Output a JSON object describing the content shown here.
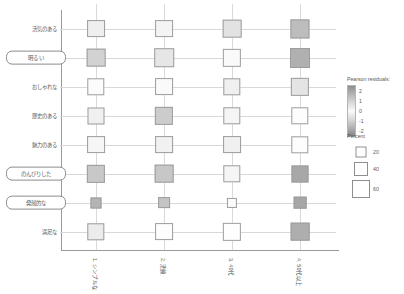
{
  "chart_data": {
    "type": "heatmap",
    "title": "",
    "xlabel": "",
    "ylabel": "",
    "grid": true,
    "x_tick_rotation": 90,
    "categories_x": [
      "1. シンプルな",
      "2. 洗練",
      "3. 40代",
      "4. 50代以上"
    ],
    "categories_y": [
      "活気のある",
      "明るい",
      "おしゃれな",
      "歴史のある",
      "魅力のある",
      "のんびりした",
      "発展的な",
      "満足な"
    ],
    "highlighted_y": [
      "明るい",
      "のんびりした",
      "発展的な"
    ],
    "cells": [
      {
        "y": "活気のある",
        "x": "1. シンプルな",
        "residual": 0.3,
        "percent": 30,
        "fill": "#efefef"
      },
      {
        "y": "活気のある",
        "x": "2. 洗練",
        "residual": 0.2,
        "percent": 30,
        "fill": "#f4f4f4"
      },
      {
        "y": "活気のある",
        "x": "3. 40代",
        "residual": 0.7,
        "percent": 32,
        "fill": "#e2e2e2"
      },
      {
        "y": "活気のある",
        "x": "4. 50代以上",
        "residual": 1.6,
        "percent": 33,
        "fill": "#bdbdbd"
      },
      {
        "y": "明るい",
        "x": "1. シンプルな",
        "residual": 1.1,
        "percent": 32,
        "fill": "#d2d2d2"
      },
      {
        "y": "明るい",
        "x": "2. 洗練",
        "residual": 0.6,
        "percent": 34,
        "fill": "#e6e6e6"
      },
      {
        "y": "明るい",
        "x": "3. 40代",
        "residual": 0.1,
        "percent": 31,
        "fill": "#fafafa"
      },
      {
        "y": "明るい",
        "x": "4. 50代以上",
        "residual": 1.9,
        "percent": 35,
        "fill": "#b0b0b0"
      },
      {
        "y": "おしゃれな",
        "x": "1. シンプルな",
        "residual": 0.1,
        "percent": 29,
        "fill": "#fbfbfb"
      },
      {
        "y": "おしゃれな",
        "x": "2. 洗練",
        "residual": 0.1,
        "percent": 30,
        "fill": "#fafafa"
      },
      {
        "y": "おしゃれな",
        "x": "3. 40代",
        "residual": 0.3,
        "percent": 29,
        "fill": "#f0f0f0"
      },
      {
        "y": "おしゃれな",
        "x": "4. 50代以上",
        "residual": 0.6,
        "percent": 31,
        "fill": "#e4e4e4"
      },
      {
        "y": "歴史のある",
        "x": "1. シンプルな",
        "residual": 0.3,
        "percent": 28,
        "fill": "#f0f0f0"
      },
      {
        "y": "歴史のある",
        "x": "2. 洗練",
        "residual": 1.2,
        "percent": 31,
        "fill": "#cccccc"
      },
      {
        "y": "歴史のある",
        "x": "3. 40代",
        "residual": 0.2,
        "percent": 29,
        "fill": "#f5f5f5"
      },
      {
        "y": "歴史のある",
        "x": "4. 50代以上",
        "residual": -0.1,
        "percent": 29,
        "fill": "#fdfdfd"
      },
      {
        "y": "魅力のある",
        "x": "1. シンプルな",
        "residual": 0.2,
        "percent": 30,
        "fill": "#f6f6f6"
      },
      {
        "y": "魅力のある",
        "x": "2. 洗練",
        "residual": 0.3,
        "percent": 30,
        "fill": "#f1f1f1"
      },
      {
        "y": "魅力のある",
        "x": "3. 40代",
        "residual": 0.3,
        "percent": 30,
        "fill": "#f0f0f0"
      },
      {
        "y": "魅力のある",
        "x": "4. 50代以上",
        "residual": -0.1,
        "percent": 29,
        "fill": "#fdfdfd"
      },
      {
        "y": "のんびりした",
        "x": "1. シンプルな",
        "residual": 1.3,
        "percent": 31,
        "fill": "#c8c8c8"
      },
      {
        "y": "のんびりした",
        "x": "2. 洗練",
        "residual": 1.3,
        "percent": 32,
        "fill": "#c7c7c7"
      },
      {
        "y": "のんびりした",
        "x": "3. 40代",
        "residual": 0.2,
        "percent": 29,
        "fill": "#f5f5f5"
      },
      {
        "y": "のんびりした",
        "x": "4. 50代以上",
        "residual": 2.0,
        "percent": 28,
        "fill": "#a8a8a8"
      },
      {
        "y": "発展的な",
        "x": "1. シンプルな",
        "residual": 1.8,
        "percent": 14,
        "fill": "#b4b4b4"
      },
      {
        "y": "発展的な",
        "x": "2. 洗練",
        "residual": 1.4,
        "percent": 16,
        "fill": "#c4c4c4"
      },
      {
        "y": "発展的な",
        "x": "3. 40代",
        "residual": 0.1,
        "percent": 12,
        "fill": "#fbfbfb"
      },
      {
        "y": "発展的な",
        "x": "4. 50代以上",
        "residual": 2.0,
        "percent": 18,
        "fill": "#a6a6a6"
      },
      {
        "y": "満足な",
        "x": "1. シンプルな",
        "residual": 0.4,
        "percent": 29,
        "fill": "#ececec"
      },
      {
        "y": "満足な",
        "x": "2. 洗練",
        "residual": 0.0,
        "percent": 30,
        "fill": "#fdfdfd"
      },
      {
        "y": "満足な",
        "x": "3. 40代",
        "residual": 0.0,
        "percent": 31,
        "fill": "#fefefe"
      },
      {
        "y": "満足な",
        "x": "4. 50代以上",
        "residual": 1.9,
        "percent": 32,
        "fill": "#aeaeae"
      }
    ]
  },
  "legends": {
    "residual": {
      "title": "Pearson residuals:",
      "ticks": [
        "2",
        "1",
        "0",
        "-1",
        "-2"
      ],
      "max": 2,
      "min": -2,
      "color_high": "#8e8e8e",
      "color_mid": "#fbfbfb",
      "color_low": "#858585"
    },
    "percent": {
      "title": "Percent",
      "items": [
        {
          "label": "20",
          "size": 11
        },
        {
          "label": "40",
          "size": 14
        },
        {
          "label": "60",
          "size": 18
        }
      ],
      "box_color": "#ffffff",
      "border_color": "#8f8f8f"
    }
  },
  "style": {
    "background": "#ffffff",
    "axis_color": "#9a9a9a",
    "grid_color": "#d8d8d8",
    "text_color": "#5a5a5a"
  }
}
